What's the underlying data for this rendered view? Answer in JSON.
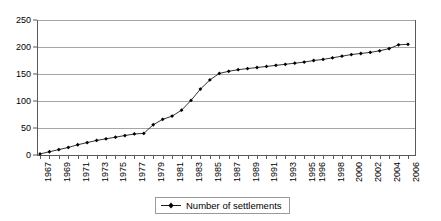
{
  "chart_data": {
    "type": "line",
    "title": "",
    "subtitle": "",
    "xlabel": "",
    "ylabel": "",
    "ylim": [
      0,
      250
    ],
    "ytick_values": [
      0,
      50,
      100,
      150,
      200,
      250
    ],
    "ytick_labels": [
      "0",
      "50",
      "100",
      "150",
      "200",
      "250"
    ],
    "grid": "horizontal",
    "legend_position": "bottom-center",
    "legend_entries": [
      "Number of settlements"
    ],
    "x": [
      "1967",
      "1968",
      "1969",
      "1970",
      "1971",
      "1972",
      "1973",
      "1974",
      "1975",
      "1976",
      "1977",
      "1978",
      "1979",
      "1980",
      "1981",
      "1982",
      "1983",
      "1984",
      "1985",
      "1986",
      "1987",
      "1988",
      "1989",
      "1990",
      "1991",
      "1992",
      "1993",
      "1994",
      "1995",
      "1996",
      "1997",
      "1998",
      "1999",
      "2000",
      "2001",
      "2002",
      "2003",
      "2004",
      "2005",
      "2006"
    ],
    "xtick_labels_shown": [
      "1967",
      "1969",
      "1971",
      "1973",
      "1975",
      "1977",
      "1979",
      "1981",
      "1983",
      "1985",
      "1987",
      "1989",
      "1991",
      "1993",
      "1995",
      "1996",
      "1998",
      "2000",
      "2002",
      "2004",
      "2006"
    ],
    "series": [
      {
        "name": "Number of settlements",
        "marker": "diamond",
        "color": "#000000",
        "values": [
          2,
          6,
          10,
          14,
          19,
          23,
          27,
          30,
          33,
          36,
          39,
          40,
          56,
          66,
          72,
          83,
          101,
          122,
          139,
          151,
          155,
          158,
          160,
          162,
          164,
          166,
          168,
          170,
          172,
          175,
          177,
          180,
          183,
          186,
          188,
          190,
          193,
          197,
          204,
          205
        ]
      }
    ]
  },
  "legend": {
    "label": "Number of settlements",
    "symbol_name": "line-with-diamond-marker"
  }
}
